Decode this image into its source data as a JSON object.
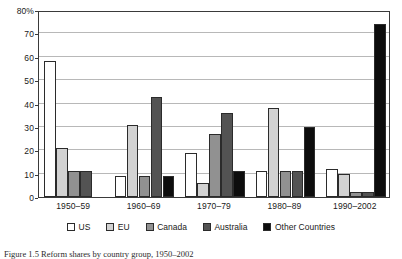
{
  "chart_data": {
    "type": "bar",
    "title": "",
    "xlabel": "",
    "ylabel": "",
    "ylim": [
      0,
      80
    ],
    "grid": true,
    "legend_position": "bottom",
    "categories": [
      "1950–59",
      "1960–69",
      "1970–79",
      "1980–89",
      "1990–2002"
    ],
    "ytick_labels": [
      "80%",
      "70",
      "60",
      "50",
      "40",
      "30",
      "20",
      "10",
      "0"
    ],
    "yticks": [
      80,
      70,
      60,
      50,
      40,
      30,
      20,
      10,
      0
    ],
    "series": [
      {
        "name": "US",
        "color": "#ffffff",
        "values": [
          58,
          9,
          19,
          11,
          12
        ]
      },
      {
        "name": "EU",
        "color": "#d2d2d2",
        "values": [
          21,
          31,
          6,
          38,
          10
        ]
      },
      {
        "name": "Canada",
        "color": "#919191",
        "values": [
          11,
          9,
          27,
          11,
          2
        ]
      },
      {
        "name": "Australia",
        "color": "#535353",
        "values": [
          11,
          43,
          36,
          11,
          2
        ]
      },
      {
        "name": "Other Countries",
        "color": "#0d0d0d",
        "values": [
          0,
          9,
          11,
          30,
          74
        ]
      }
    ]
  },
  "caption": {
    "text": "Figure 1.5  Reform shares by country group, 1950–2002"
  }
}
